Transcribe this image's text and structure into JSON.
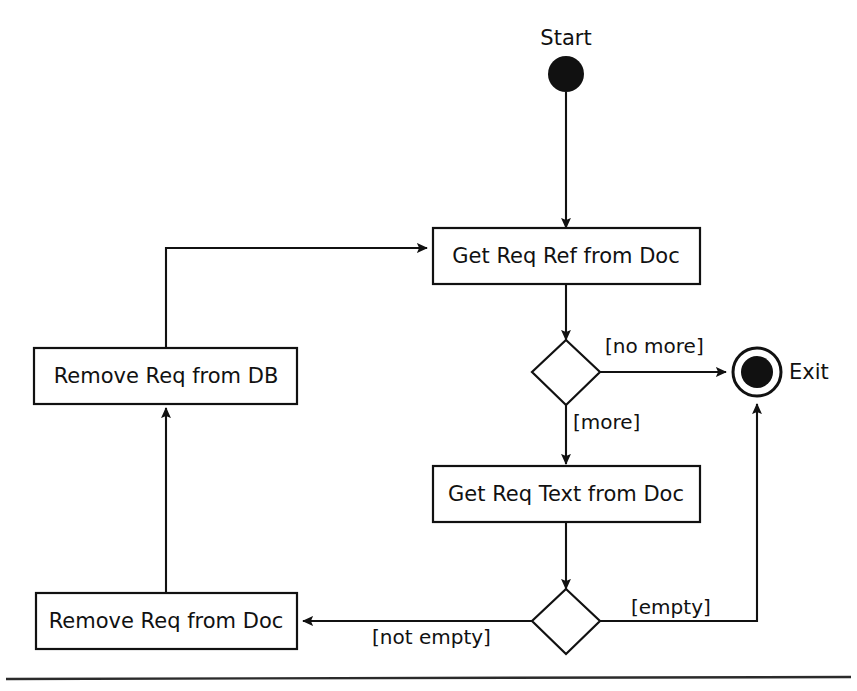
{
  "diagram": {
    "type": "uml-activity-diagram",
    "colors": {
      "ink": "#111111",
      "background": "#ffffff",
      "rule": "#2b2b2b"
    },
    "start": {
      "label": "Start",
      "node_name": "initial-node"
    },
    "end": {
      "label": "Exit",
      "node_name": "final-node"
    },
    "activities": [
      {
        "id": "get-req-ref",
        "label": "Get Req Ref from Doc"
      },
      {
        "id": "get-req-text",
        "label": "Get Req Text from Doc"
      },
      {
        "id": "remove-req-db",
        "label": "Remove Req from DB"
      },
      {
        "id": "remove-req-doc",
        "label": "Remove Req from Doc"
      }
    ],
    "decisions": [
      {
        "id": "more-decision",
        "guards": [
          "[no more]",
          "[more]"
        ]
      },
      {
        "id": "empty-decision",
        "guards": [
          "[empty]",
          "[not empty]"
        ]
      }
    ],
    "guards": {
      "no_more": "[no more]",
      "more": "[more]",
      "empty": "[empty]",
      "not_empty": "[not empty]"
    },
    "transitions": [
      {
        "from": "Start",
        "to": "Get Req Ref from Doc",
        "guard": ""
      },
      {
        "from": "Get Req Ref from Doc",
        "to": "more-decision",
        "guard": ""
      },
      {
        "from": "more-decision",
        "to": "Exit",
        "guard": "[no more]"
      },
      {
        "from": "more-decision",
        "to": "Get Req Text from Doc",
        "guard": "[more]"
      },
      {
        "from": "Get Req Text from Doc",
        "to": "empty-decision",
        "guard": ""
      },
      {
        "from": "empty-decision",
        "to": "Exit",
        "guard": "[empty]"
      },
      {
        "from": "empty-decision",
        "to": "Remove Req from Doc",
        "guard": "[not empty]"
      },
      {
        "from": "Remove Req from Doc",
        "to": "Remove Req from DB",
        "guard": ""
      },
      {
        "from": "Remove Req from DB",
        "to": "Get Req Ref from Doc",
        "guard": ""
      }
    ]
  }
}
